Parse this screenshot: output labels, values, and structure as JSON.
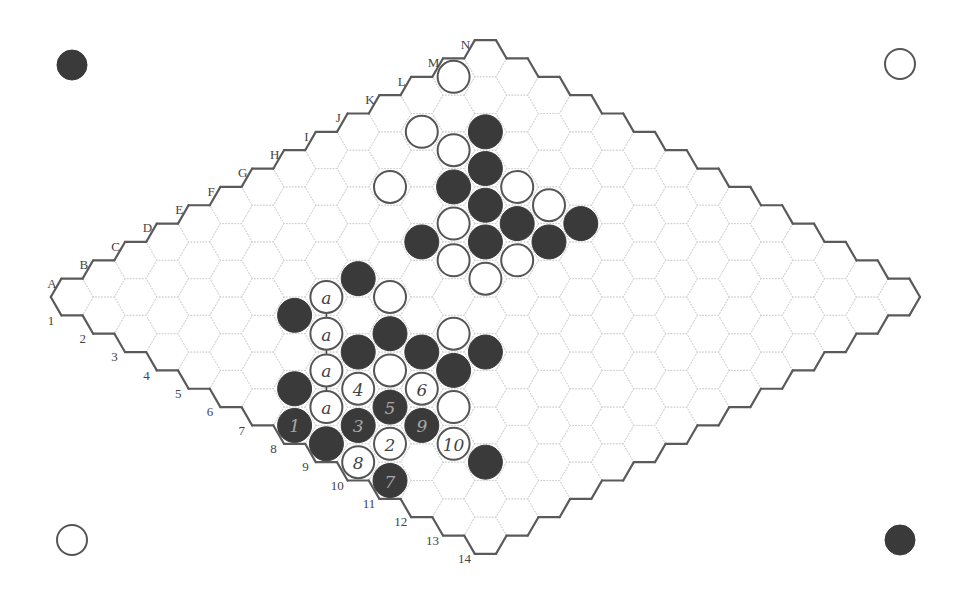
{
  "board": {
    "size": 14,
    "origin": [
      72,
      297
    ],
    "step_x": 31.8,
    "step_y": 18.35,
    "hex_radius": 21.2,
    "stone_radius": 17,
    "colors": {
      "black_stone": "#3a3a3a",
      "white_stone_fill": "#ffffff",
      "white_stone_outline": "#555555",
      "border": "#5a5a5a",
      "grid": "#d2d2d2",
      "label": "#444444"
    }
  },
  "column_labels": [
    "A",
    "B",
    "C",
    "D",
    "E",
    "F",
    "G",
    "H",
    "I",
    "J",
    "K",
    "L",
    "M",
    "N"
  ],
  "row_labels": [
    "1",
    "2",
    "3",
    "4",
    "5",
    "6",
    "7",
    "8",
    "9",
    "10",
    "11",
    "12",
    "13",
    "14"
  ],
  "corner_markers": [
    {
      "position": "top-left",
      "color": "black",
      "x": 72,
      "y": 65
    },
    {
      "position": "top-right",
      "color": "white",
      "x": 900,
      "y": 64
    },
    {
      "position": "bottom-left",
      "color": "white",
      "x": 72,
      "y": 540
    },
    {
      "position": "bottom-right",
      "color": "black",
      "x": 900,
      "y": 540
    }
  ],
  "stones": [
    {
      "cell": "M1",
      "c": 12,
      "r": 0,
      "color": "white",
      "label": ""
    },
    {
      "cell": "K2",
      "c": 10,
      "r": 1,
      "color": "white",
      "label": ""
    },
    {
      "cell": "L3",
      "c": 11,
      "r": 2,
      "color": "black",
      "label": ""
    },
    {
      "cell": "K3",
      "c": 10,
      "r": 2,
      "color": "white",
      "label": ""
    },
    {
      "cell": "K4",
      "c": 10,
      "r": 3,
      "color": "black",
      "label": ""
    },
    {
      "cell": "I3",
      "c": 8,
      "r": 2,
      "color": "white",
      "label": ""
    },
    {
      "cell": "J4",
      "c": 9,
      "r": 3,
      "color": "black",
      "label": ""
    },
    {
      "cell": "K5",
      "c": 10,
      "r": 4,
      "color": "white",
      "label": ""
    },
    {
      "cell": "J5",
      "c": 9,
      "r": 4,
      "color": "black",
      "label": ""
    },
    {
      "cell": "K6",
      "c": 10,
      "r": 5,
      "color": "white",
      "label": ""
    },
    {
      "cell": "I5",
      "c": 8,
      "r": 4,
      "color": "white",
      "label": ""
    },
    {
      "cell": "J6",
      "c": 9,
      "r": 5,
      "color": "black",
      "label": ""
    },
    {
      "cell": "K7",
      "c": 10,
      "r": 6,
      "color": "black",
      "label": ""
    },
    {
      "cell": "H5",
      "c": 7,
      "r": 4,
      "color": "black",
      "label": ""
    },
    {
      "cell": "I6",
      "c": 8,
      "r": 5,
      "color": "black",
      "label": ""
    },
    {
      "cell": "J7",
      "c": 9,
      "r": 6,
      "color": "black",
      "label": ""
    },
    {
      "cell": "H6",
      "c": 7,
      "r": 5,
      "color": "white",
      "label": ""
    },
    {
      "cell": "I7",
      "c": 8,
      "r": 6,
      "color": "white",
      "label": ""
    },
    {
      "cell": "H7",
      "c": 7,
      "r": 6,
      "color": "white",
      "label": ""
    },
    {
      "cell": "F5",
      "c": 5,
      "r": 4,
      "color": "black",
      "label": ""
    },
    {
      "cell": "E5",
      "c": 4,
      "r": 4,
      "color": "white",
      "label": "a"
    },
    {
      "cell": "F6",
      "c": 5,
      "r": 5,
      "color": "white",
      "label": ""
    },
    {
      "cell": "D5",
      "c": 3,
      "r": 4,
      "color": "black",
      "label": ""
    },
    {
      "cell": "D6",
      "c": 3,
      "r": 5,
      "color": "white",
      "label": "a"
    },
    {
      "cell": "E7",
      "c": 4,
      "r": 6,
      "color": "black",
      "label": ""
    },
    {
      "cell": "F8",
      "c": 5,
      "r": 7,
      "color": "white",
      "label": ""
    },
    {
      "cell": "D7",
      "c": 3,
      "r": 6,
      "color": "black",
      "label": ""
    },
    {
      "cell": "E8",
      "c": 4,
      "r": 7,
      "color": "black",
      "label": ""
    },
    {
      "cell": "F9",
      "c": 5,
      "r": 8,
      "color": "black",
      "label": ""
    },
    {
      "cell": "C7",
      "c": 2,
      "r": 6,
      "color": "white",
      "label": "a"
    },
    {
      "cell": "D8",
      "c": 3,
      "r": 7,
      "color": "white",
      "label": ""
    },
    {
      "cell": "E9",
      "c": 4,
      "r": 8,
      "color": "black",
      "label": ""
    },
    {
      "cell": "B7",
      "c": 1,
      "r": 6,
      "color": "black",
      "label": ""
    },
    {
      "cell": "C8",
      "c": 2,
      "r": 7,
      "color": "white",
      "label": "4"
    },
    {
      "cell": "D9",
      "c": 3,
      "r": 8,
      "color": "white",
      "label": "6"
    },
    {
      "cell": "B8",
      "c": 1,
      "r": 7,
      "color": "white",
      "label": "a"
    },
    {
      "cell": "C9",
      "c": 2,
      "r": 8,
      "color": "black",
      "label": "5"
    },
    {
      "cell": "D10",
      "c": 3,
      "r": 9,
      "color": "white",
      "label": ""
    },
    {
      "cell": "A8",
      "c": 0,
      "r": 7,
      "color": "black",
      "label": "1"
    },
    {
      "cell": "B9",
      "c": 1,
      "r": 8,
      "color": "black",
      "label": "3"
    },
    {
      "cell": "C10",
      "c": 2,
      "r": 9,
      "color": "black",
      "label": "9"
    },
    {
      "cell": "A9",
      "c": 0,
      "r": 8,
      "color": "black",
      "label": ""
    },
    {
      "cell": "B10",
      "c": 1,
      "r": 9,
      "color": "white",
      "label": "2"
    },
    {
      "cell": "C11",
      "c": 2,
      "r": 10,
      "color": "white",
      "label": "10"
    },
    {
      "cell": "A10",
      "c": 0,
      "r": 9,
      "color": "white",
      "label": "8"
    },
    {
      "cell": "C12",
      "c": 2,
      "r": 11,
      "color": "black",
      "label": ""
    },
    {
      "cell": "A11",
      "c": 0,
      "r": 10,
      "color": "black",
      "label": "7"
    }
  ],
  "links": [
    {
      "from": "E5",
      "to": "D6"
    },
    {
      "from": "D6",
      "to": "C7"
    },
    {
      "from": "C7",
      "to": "B8"
    }
  ]
}
